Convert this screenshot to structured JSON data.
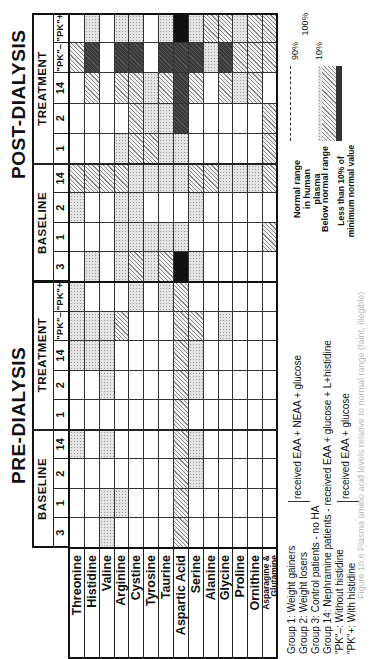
{
  "figure": {
    "sections": [
      {
        "id": "pre",
        "title": "PRE-DIALYSIS"
      },
      {
        "id": "post",
        "title": "POST-DIALYSIS"
      }
    ],
    "subheaders": {
      "baseline": "BASELINE",
      "treatment": "TREATMENT"
    },
    "columns": {
      "pre_baseline": [
        "3",
        "1",
        "2",
        "14"
      ],
      "pre_treatment": [
        "1",
        "2",
        "14",
        "\"PK\"–",
        "\"PK\"+"
      ],
      "post_baseline": [
        "3",
        "1",
        "2",
        "14"
      ],
      "post_treatment": [
        "1",
        "2",
        "14",
        "\"PK\"–",
        "\"PK\"+"
      ]
    },
    "rows": [
      "Threonine",
      "Histidine",
      "Valine",
      "Arginine",
      "Cystine",
      "Tyrosine",
      "Taurine",
      "Aspartic Acid",
      "Serine",
      "Alanine",
      "Glycine",
      "Proline",
      "Ornithine",
      "Asparagine & Glutamine"
    ],
    "legend_footnote": [
      "Group 1: Weight gainers",
      "Group 2: Weight losers",
      "Group 3: Control patients - no HA",
      "Group 14: Nephramine patients - received EAA + glucose + L+histidine",
      "\"PK\"–: Without histidine",
      "\"PK\"+: With histidine"
    ],
    "legend_brackets": [
      {
        "groups": "Groups 1–2",
        "text": "received EAA + NEAA + glucose"
      },
      {
        "groups": "\"PK\"± ",
        "text": "received EAA + glucose"
      }
    ],
    "scale_legend": {
      "labels": [
        "Normal range in human plasma",
        "Below normal range",
        "Less than 10% of minimum normal value"
      ],
      "percent_labels": [
        "90%",
        "10%",
        "100%"
      ]
    },
    "caption": "Figure 10.6 Plasma amino acid levels relative to normal range (faint, illegible)"
  },
  "chart_data": {
    "type": "heatmap",
    "shading_key": {
      "w": "Normal range in human plasma",
      "d": "Below normal range (light)",
      "h": "Below normal range",
      "k": "Well below normal range",
      "b": "Less than 10% of minimum normal value"
    },
    "rows": [
      "Threonine",
      "Histidine",
      "Valine",
      "Arginine",
      "Cystine",
      "Tyrosine",
      "Taurine",
      "Aspartic Acid",
      "Serine",
      "Alanine",
      "Glycine",
      "Proline",
      "Ornithine",
      "Asparagine & Glutamine"
    ],
    "columns": [
      "PRE B3",
      "PRE B1",
      "PRE B2",
      "PRE B14",
      "PRE T1",
      "PRE T2",
      "PRE T14",
      "PRE PK-",
      "PRE PK+",
      "POST B3",
      "POST B1",
      "POST B2",
      "POST B14",
      "POST T1",
      "POST T2",
      "POST T14",
      "POST PK-",
      "POST PK+"
    ],
    "values": [
      [
        "w",
        "w",
        "w",
        "d",
        "w",
        "w",
        "d",
        "d",
        "d",
        "w",
        "w",
        "d",
        "h",
        "w",
        "w",
        "w",
        "h",
        "w"
      ],
      [
        "w",
        "w",
        "w",
        "w",
        "w",
        "w",
        "d",
        "d",
        "w",
        "d",
        "w",
        "w",
        "h",
        "w",
        "w",
        "h",
        "k",
        "d"
      ],
      [
        "d",
        "d",
        "w",
        "d",
        "w",
        "d",
        "d",
        "d",
        "w",
        "w",
        "w",
        "w",
        "h",
        "w",
        "w",
        "w",
        "w",
        "w"
      ],
      [
        "w",
        "d",
        "w",
        "w",
        "w",
        "w",
        "w",
        "h",
        "w",
        "d",
        "d",
        "d",
        "h",
        "d",
        "w",
        "h",
        "k",
        "d"
      ],
      [
        "w",
        "w",
        "w",
        "w",
        "w",
        "w",
        "w",
        "w",
        "d",
        "h",
        "d",
        "d",
        "d",
        "h",
        "h",
        "h",
        "k",
        "d"
      ],
      [
        "w",
        "w",
        "w",
        "w",
        "w",
        "w",
        "w",
        "w",
        "w",
        "d",
        "d",
        "w",
        "d",
        "h",
        "d",
        "d",
        "w",
        "w"
      ],
      [
        "w",
        "w",
        "w",
        "w",
        "w",
        "w",
        "w",
        "w",
        "d",
        "h",
        "d",
        "w",
        "d",
        "d",
        "d",
        "h",
        "k",
        "d"
      ],
      [
        "h",
        "h",
        "h",
        "h",
        "h",
        "h",
        "h",
        "h",
        "h",
        "b",
        "d",
        "w",
        "d",
        "d",
        "k",
        "k",
        "k",
        "b"
      ],
      [
        "w",
        "w",
        "d",
        "d",
        "w",
        "d",
        "d",
        "h",
        "w",
        "d",
        "w",
        "d",
        "h",
        "w",
        "w",
        "h",
        "k",
        "d"
      ],
      [
        "w",
        "w",
        "w",
        "w",
        "w",
        "w",
        "w",
        "w",
        "w",
        "w",
        "w",
        "w",
        "h",
        "w",
        "w",
        "w",
        "d",
        "h"
      ],
      [
        "w",
        "w",
        "w",
        "w",
        "w",
        "w",
        "w",
        "d",
        "w",
        "w",
        "w",
        "w",
        "d",
        "w",
        "w",
        "h",
        "k",
        "h"
      ],
      [
        "w",
        "w",
        "w",
        "w",
        "w",
        "w",
        "w",
        "w",
        "w",
        "w",
        "w",
        "w",
        "d",
        "w",
        "w",
        "d",
        "h",
        "d"
      ],
      [
        "w",
        "w",
        "w",
        "w",
        "w",
        "w",
        "w",
        "w",
        "w",
        "w",
        "w",
        "w",
        "d",
        "w",
        "w",
        "h",
        "h",
        "h"
      ],
      [
        "w",
        "w",
        "w",
        "w",
        "w",
        "w",
        "w",
        "w",
        "w",
        "w",
        "h",
        "w",
        "h",
        "h",
        "h",
        "w",
        "h",
        "h"
      ]
    ]
  }
}
